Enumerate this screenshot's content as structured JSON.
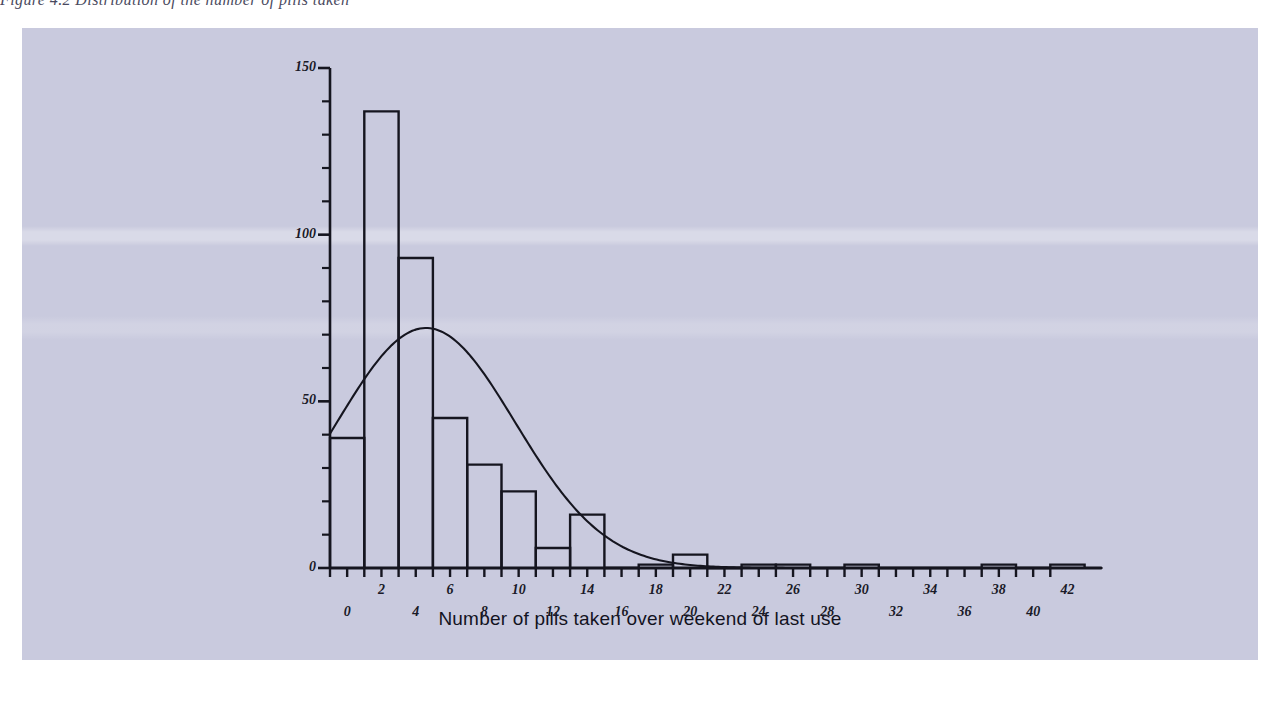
{
  "page": {
    "background_color": "#ffffff",
    "caption_partial": "Figure 4.2   Distribution of the number of pills taken",
    "chart_panel_color": "#c9cade",
    "ink_color": "#15151f"
  },
  "chart_data": {
    "type": "bar",
    "title": "",
    "subtitle": "",
    "xlabel": "Number of pills taken over weekend of last use",
    "ylabel": "",
    "xlim": [
      -1,
      43
    ],
    "ylim": [
      0,
      150
    ],
    "grid": false,
    "legend": null,
    "y_ticks_major": [
      0,
      50,
      100,
      150
    ],
    "y_tick_minor_step": 10,
    "x_ticks": [
      0,
      1,
      2,
      3,
      4,
      5,
      6,
      7,
      8,
      9,
      10,
      11,
      12,
      13,
      14,
      15,
      16,
      17,
      18,
      19,
      20,
      21,
      22,
      23,
      24,
      25,
      26,
      27,
      28,
      29,
      30,
      31,
      32,
      33,
      34,
      35,
      36,
      37,
      38,
      39,
      40,
      41,
      42
    ],
    "x_tick_labels_row1": [
      2,
      6,
      10,
      14,
      18,
      22,
      26,
      30,
      34,
      38,
      42
    ],
    "x_tick_labels_row2": [
      0,
      4,
      8,
      12,
      16,
      20,
      24,
      28,
      32,
      36,
      40
    ],
    "bar_style": "unfilled-outline",
    "bar_width_units": 2,
    "categories": [
      0,
      2,
      4,
      6,
      8,
      10,
      12,
      14,
      16,
      18,
      20,
      22,
      24,
      26,
      28,
      30,
      32,
      34,
      36,
      38,
      40,
      42
    ],
    "values": [
      39,
      137,
      93,
      45,
      31,
      23,
      6,
      16,
      0,
      1,
      4,
      0,
      1,
      1,
      0,
      1,
      0,
      0,
      0,
      1,
      0,
      1
    ],
    "overlay_curve": {
      "name": "normal-distribution-curve",
      "type": "line",
      "mean": 4.6,
      "stddev": 5.2,
      "peak_value": 72,
      "peak_x": 4.6,
      "description": "fitted normal curve overlaid on histogram"
    }
  }
}
